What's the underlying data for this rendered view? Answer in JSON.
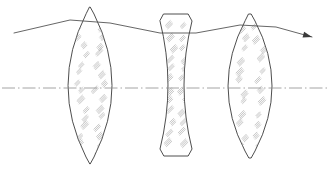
{
  "figure": {
    "background_color": "#ffffff",
    "width": 329,
    "height": 171,
    "outline_color": "#3a3a3a",
    "hatch_color": "#9a9a9a",
    "axis_color": "#8d8d8d",
    "ray_color": "#4a4a4a"
  },
  "optical_axis": {
    "label": "optical-axis",
    "style": "dash-dot",
    "y": 88,
    "x_start": 2,
    "x_end": 327
  },
  "elements": [
    {
      "name": "lens-1",
      "type": "biconvex",
      "center_x": 90,
      "top_y": 7,
      "bottom_y": 164,
      "edge_half_width": 4,
      "center_half_width": 22,
      "bevel": 7,
      "hatch_count": 16
    },
    {
      "name": "lens-2",
      "type": "biconcave",
      "center_x": 176,
      "top_y": 14,
      "bottom_y": 156,
      "edge_half_width": 16,
      "center_half_width": 8,
      "bevel": 7,
      "hatch_count": 12
    },
    {
      "name": "lens-3",
      "type": "biconvex",
      "center_x": 250,
      "top_y": 14,
      "bottom_y": 158,
      "edge_half_width": 5,
      "center_half_width": 22,
      "bevel": 7,
      "hatch_count": 12
    }
  ],
  "ray": {
    "name": "traced-ray",
    "has_arrowhead": true,
    "arrow_at": "right-end",
    "points": [
      {
        "x": 14,
        "y": 33
      },
      {
        "x": 70,
        "y": 20
      },
      {
        "x": 110,
        "y": 23
      },
      {
        "x": 160,
        "y": 33
      },
      {
        "x": 196,
        "y": 33
      },
      {
        "x": 240,
        "y": 25
      },
      {
        "x": 276,
        "y": 27
      },
      {
        "x": 312,
        "y": 37
      }
    ]
  }
}
